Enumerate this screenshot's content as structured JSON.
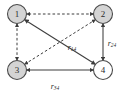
{
  "figure": {
    "type": "directed-graph-diagram",
    "background_color": "#ffffff",
    "width": 121,
    "height": 97
  },
  "nodes": [
    {
      "id": "1",
      "label": "1",
      "cx": 17,
      "cy": 14,
      "r": 9.5,
      "fill": "#d4d4d4",
      "stroke": "#4a4a4a",
      "style": "filled"
    },
    {
      "id": "2",
      "label": "2",
      "cx": 103,
      "cy": 14,
      "r": 9.5,
      "fill": "#d4d4d4",
      "stroke": "#4a4a4a",
      "style": "filled"
    },
    {
      "id": "3",
      "label": "3",
      "cx": 17,
      "cy": 70,
      "r": 9.5,
      "fill": "#d4d4d4",
      "stroke": "#4a4a4a",
      "style": "filled"
    },
    {
      "id": "4",
      "label": "4",
      "cx": 103,
      "cy": 70,
      "r": 9.5,
      "fill": "#ffffff",
      "stroke": "#4a4a4a",
      "style": "empty"
    }
  ],
  "edges": [
    {
      "id": "e12",
      "from": "2",
      "to": "1",
      "line": "dashed",
      "arrows": "both",
      "label": "",
      "sub": ""
    },
    {
      "id": "e13",
      "from": "1",
      "to": "3",
      "line": "dashed",
      "arrows": "both",
      "label": "",
      "sub": ""
    },
    {
      "id": "e32",
      "from": "3",
      "to": "2",
      "line": "dashed",
      "arrows": "both",
      "label": "",
      "sub": ""
    },
    {
      "id": "e14",
      "from": "1",
      "to": "4",
      "line": "solid",
      "arrows": "both",
      "label": "r",
      "sub": "14"
    },
    {
      "id": "e24",
      "from": "2",
      "to": "4",
      "line": "solid",
      "arrows": "both",
      "label": "r",
      "sub": "24"
    },
    {
      "id": "e34",
      "from": "3",
      "to": "4",
      "line": "solid",
      "arrows": "both",
      "label": "r",
      "sub": "34"
    }
  ],
  "edge_labels": [
    {
      "id": "lbl_r14",
      "base": "r",
      "sub": "14",
      "x": 72,
      "y": 47
    },
    {
      "id": "lbl_r24",
      "base": "r",
      "sub": "24",
      "x": 115,
      "y": 43
    },
    {
      "id": "lbl_r34",
      "base": "r",
      "sub": "34",
      "x": 58,
      "y": 86
    }
  ],
  "colors": {
    "node_fill_gray": "#d4d4d4",
    "node_fill_white": "#ffffff",
    "node_stroke": "#4a4a4a",
    "edge_stroke": "#3d3d3d",
    "text": "#2b2b2b"
  }
}
